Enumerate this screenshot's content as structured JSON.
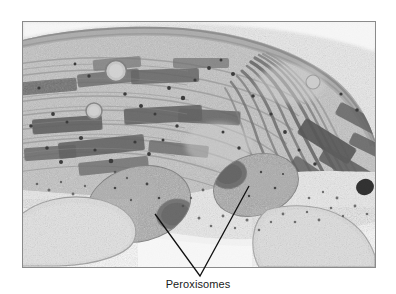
{
  "figure": {
    "type": "electron-micrograph",
    "caption": "Peroxisomes",
    "frame": {
      "x": 22,
      "y": 21,
      "width": 354,
      "height": 247,
      "border_color": "#8a8a8a"
    },
    "background_color": "#ffffff",
    "leader_lines": {
      "name": "peroxisome-pointer-lines",
      "apex": {
        "x": 200,
        "y": 276
      },
      "left_tip": {
        "x": 155,
        "y": 214
      },
      "right_tip": {
        "x": 249,
        "y": 186
      },
      "color": "#111111",
      "width": 1.3
    },
    "labels": [
      {
        "name": "peroxisomes-label",
        "text": "Peroxisomes",
        "x": 200,
        "y": 289,
        "font_size": 11,
        "color": "#1a1a1a"
      }
    ],
    "structures": [
      {
        "name": "granum-stack",
        "tone": "dark",
        "count": 12
      },
      {
        "name": "stroma-thylakoid",
        "tone": "mid",
        "count": 14
      },
      {
        "name": "chloroplast-envelope",
        "tone": "light"
      },
      {
        "name": "peroxisome-left",
        "cx": 130,
        "cy": 198,
        "rx": 48,
        "ry": 34,
        "tone": "mid-dark"
      },
      {
        "name": "peroxisome-right",
        "cx": 248,
        "cy": 182,
        "rx": 40,
        "ry": 28,
        "tone": "mid-dark"
      },
      {
        "name": "crystalline-core-left",
        "cx": 172,
        "cy": 205,
        "rx": 16,
        "ry": 13,
        "tone": "dark"
      },
      {
        "name": "crystalline-core-right",
        "cx": 226,
        "cy": 172,
        "rx": 16,
        "ry": 13,
        "tone": "dark"
      },
      {
        "name": "vesicle-upper",
        "cx": 114,
        "cy": 70,
        "r": 10,
        "tone": "light"
      },
      {
        "name": "vesicle-lower",
        "cx": 93,
        "cy": 110,
        "r": 8,
        "tone": "light"
      },
      {
        "name": "mitochondrion-lower-left",
        "cx": 70,
        "cy": 225,
        "rx": 48,
        "ry": 30,
        "tone": "light"
      },
      {
        "name": "dense-granule",
        "cx": 364,
        "cy": 186,
        "rx": 8,
        "ry": 7,
        "tone": "black"
      },
      {
        "name": "cytosol-region",
        "tone": "very-light"
      }
    ],
    "colors": {
      "darkest": "#3a3a3a",
      "dark": "#555555",
      "mid": "#8c8c8c",
      "light": "#c2c2c2",
      "lightest": "#eeeeee",
      "black": "#141414"
    }
  }
}
